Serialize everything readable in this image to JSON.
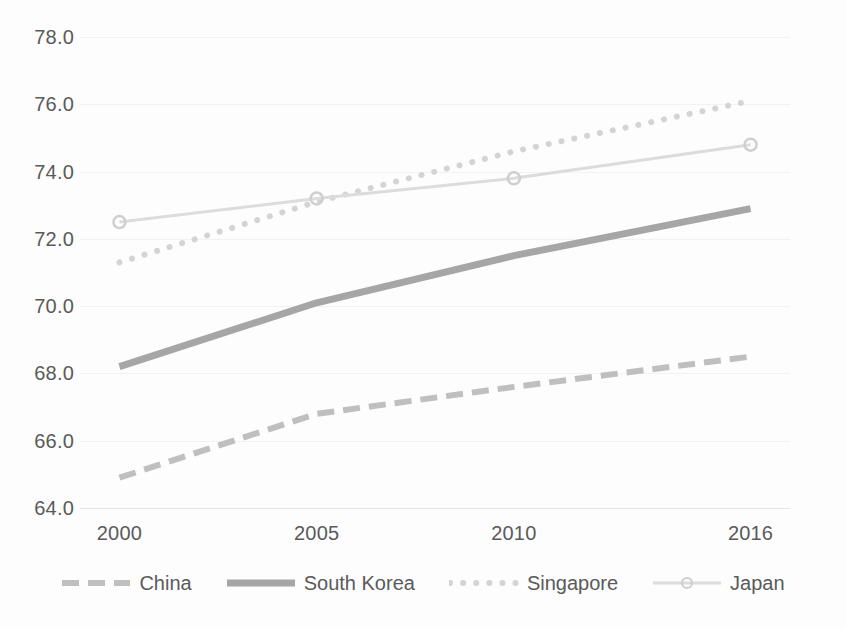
{
  "chart_data": {
    "type": "line",
    "title": "",
    "xlabel": "",
    "ylabel": "",
    "categories": [
      "2000",
      "2005",
      "2010",
      "2016"
    ],
    "x": [
      2000,
      2005,
      2010,
      2016
    ],
    "xlim": [
      1999,
      2017
    ],
    "ylim": [
      64.0,
      78.0
    ],
    "ytick_labels": [
      "64.0",
      "66.0",
      "68.0",
      "70.0",
      "72.0",
      "74.0",
      "76.0",
      "78.0"
    ],
    "yticks": [
      64.0,
      66.0,
      68.0,
      70.0,
      72.0,
      74.0,
      76.0,
      78.0
    ],
    "grid": true,
    "legend_position": "bottom",
    "series": [
      {
        "name": "China",
        "values": [
          64.9,
          66.8,
          67.6,
          68.5
        ],
        "style": "dashed",
        "color": "#bfbfbf",
        "marker": "none"
      },
      {
        "name": "South Korea",
        "values": [
          68.2,
          70.1,
          71.5,
          72.9
        ],
        "style": "solid",
        "color": "#a6a6a6",
        "marker": "none"
      },
      {
        "name": "Singapore",
        "values": [
          71.3,
          73.1,
          74.6,
          76.1
        ],
        "style": "dotted",
        "color": "#d4d4d4",
        "marker": "none"
      },
      {
        "name": "Japan",
        "values": [
          72.5,
          73.2,
          73.8,
          74.8
        ],
        "style": "solid-thin",
        "color": "#dcdcdc",
        "marker": "circle"
      }
    ]
  },
  "axes": {
    "y_ticks": [
      {
        "label": "78.0",
        "value": 78.0
      },
      {
        "label": "76.0",
        "value": 76.0
      },
      {
        "label": "74.0",
        "value": 74.0
      },
      {
        "label": "72.0",
        "value": 72.0
      },
      {
        "label": "70.0",
        "value": 70.0
      },
      {
        "label": "68.0",
        "value": 68.0
      },
      {
        "label": "66.0",
        "value": 66.0
      },
      {
        "label": "64.0",
        "value": 64.0
      }
    ],
    "x_ticks": [
      {
        "label": "2000"
      },
      {
        "label": "2005"
      },
      {
        "label": "2010"
      },
      {
        "label": "2016"
      }
    ]
  },
  "legend": {
    "items": [
      {
        "label": "China",
        "icon": "dashed-line-icon"
      },
      {
        "label": "South Korea",
        "icon": "solid-line-icon"
      },
      {
        "label": "Singapore",
        "icon": "dotted-line-icon"
      },
      {
        "label": "Japan",
        "icon": "line-with-marker-icon"
      }
    ]
  },
  "colors": {
    "grid": "#f2f2f2",
    "axis": "#e6e6e6",
    "text": "#5a5a5a",
    "background": "#fdfdfd"
  }
}
